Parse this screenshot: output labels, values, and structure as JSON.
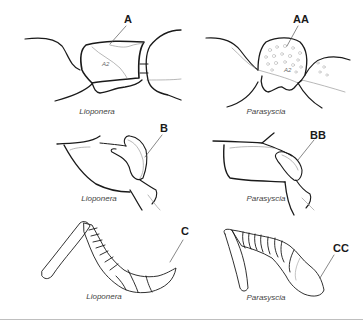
{
  "figure": {
    "panels": [
      {
        "id": "A",
        "label": "A",
        "genus": "Lioponera",
        "inner_label": "A2",
        "structure": "petiole / abdominal segment II (dorsal view, smooth)"
      },
      {
        "id": "AA",
        "label": "AA",
        "genus": "Parasyscia",
        "inner_label": "A2",
        "structure": "petiole / abdominal segment II (dorsal view, sculptured)"
      },
      {
        "id": "B",
        "label": "B",
        "genus": "Lioponera",
        "structure": "head / mandible region"
      },
      {
        "id": "BB",
        "label": "BB",
        "genus": "Parasyscia",
        "structure": "head / mandible region"
      },
      {
        "id": "C",
        "label": "C",
        "genus": "Lioponera",
        "structure": "antenna with gradually thickened club"
      },
      {
        "id": "CC",
        "label": "CC",
        "genus": "Parasyscia",
        "structure": "antenna with large bulbous apical segment"
      }
    ]
  },
  "colors": {
    "stroke_dark": "#1a1a1a",
    "stroke_light": "#9a9a9a",
    "caption": "#444444",
    "rule": "#bfbfbf",
    "background": "#ffffff"
  }
}
